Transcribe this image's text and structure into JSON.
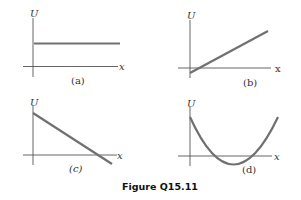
{
  "figure": {
    "caption": "Figure Q15.11",
    "panels": [
      {
        "id": "a",
        "label": "(a)",
        "y_axis": "U",
        "x_axis": "x",
        "shape": "horizontal line above x-axis"
      },
      {
        "id": "b",
        "label": "(b)",
        "y_axis": "U",
        "x_axis": "x",
        "shape": "increasing line, starts slightly below x-axis"
      },
      {
        "id": "c",
        "label": "(c)",
        "y_axis": "U",
        "x_axis": "x",
        "shape": "decreasing line crossing x-axis"
      },
      {
        "id": "d",
        "label": "(d)",
        "y_axis": "U",
        "x_axis": "x",
        "shape": "parabola dipping slightly below x-axis"
      }
    ]
  },
  "colors": {
    "curve": "#707070",
    "axis": "#555555"
  }
}
